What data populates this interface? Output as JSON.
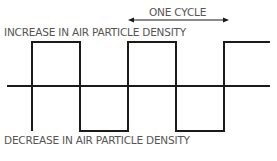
{
  "diagram": {
    "type": "square-wave",
    "labels": {
      "increase": "INCREASE IN AIR PARTICLE DENSITY",
      "decrease": "DECREASE IN AIR PARTICLE DENSITY",
      "cycle": "ONE CYCLE"
    },
    "colors": {
      "stroke": "#1a1a1a",
      "text": "#555555",
      "background": "#ffffff"
    },
    "geometry": {
      "baseline_y": 86,
      "high_y": 42,
      "low_y": 131,
      "edges_x": [
        32,
        80,
        128,
        176,
        224
      ],
      "baseline_x": [
        7,
        270
      ],
      "cycle_arrow": {
        "x1": 128,
        "x2": 228,
        "y": 20
      }
    }
  }
}
